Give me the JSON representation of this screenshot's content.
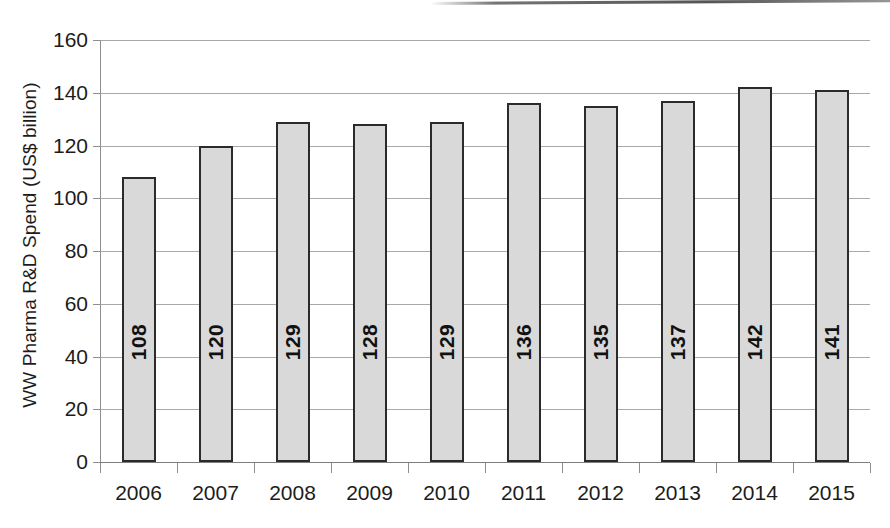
{
  "chart_data": {
    "type": "bar",
    "title": "",
    "subtitle": "",
    "xlabel": "",
    "ylabel": "WW Pharma R&D Spend (US$ billion)",
    "categories": [
      "2006",
      "2007",
      "2008",
      "2009",
      "2010",
      "2011",
      "2012",
      "2013",
      "2014",
      "2015"
    ],
    "values": [
      108,
      120,
      129,
      128,
      129,
      136,
      135,
      137,
      142,
      141
    ],
    "data_labels": [
      "108",
      "120",
      "129",
      "128",
      "129",
      "136",
      "135",
      "137",
      "142",
      "141"
    ],
    "ylim": [
      0,
      160
    ],
    "ytick_values": [
      0,
      20,
      40,
      60,
      80,
      100,
      120,
      140,
      160
    ],
    "ytick_labels": [
      "0",
      "20",
      "40",
      "60",
      "80",
      "100",
      "120",
      "140",
      "160"
    ],
    "grid": "horizontal",
    "legend": "none",
    "legend_position": "none",
    "bar_fill_color": "#d9d9d9",
    "bar_border_color": "#2b2b2b",
    "gridline_color": "#9a9a9a",
    "axis_color": "#7d7d7d",
    "text_color": "#1c1c1c",
    "background_color": "#ffffff",
    "data_label_orientation": "vertical"
  }
}
